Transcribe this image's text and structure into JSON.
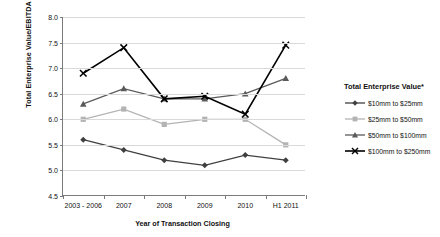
{
  "chart_data": {
    "type": "line",
    "title": "",
    "xlabel": "Year of Transaction Closing",
    "ylabel": "Total Enterprise Value/EBITDA",
    "categories": [
      "2003 - 2006",
      "2007",
      "2008",
      "2009",
      "2010",
      "H1 2011"
    ],
    "ylim": [
      4.5,
      8.0
    ],
    "ytick_step": 0.5,
    "yticks": [
      "8.0",
      "7.5",
      "7.0",
      "6.5",
      "6.0",
      "5.5",
      "5.0",
      "4.5"
    ],
    "ytick_values": [
      8.0,
      7.5,
      7.0,
      6.5,
      6.0,
      5.5,
      5.0,
      4.5
    ],
    "grid": true,
    "legend_position": "right",
    "legend_title": "Total Enterprise Value*",
    "series": [
      {
        "name": "$10mm to $25mm",
        "marker": "diamond",
        "color": "#404040",
        "values": [
          5.6,
          5.4,
          5.2,
          5.1,
          5.3,
          5.2
        ]
      },
      {
        "name": "$25mm to $50mm",
        "marker": "square",
        "color": "#b3b3b3",
        "values": [
          6.0,
          6.2,
          5.9,
          6.0,
          6.0,
          5.5
        ]
      },
      {
        "name": "$50mm to $100mm",
        "marker": "triangle",
        "color": "#5a5a5a",
        "values": [
          6.3,
          6.6,
          6.4,
          6.4,
          6.5,
          6.8
        ]
      },
      {
        "name": "$100mm to $250mm",
        "marker": "cross",
        "color": "#000000",
        "values": [
          6.9,
          7.4,
          6.4,
          6.45,
          6.1,
          7.45
        ]
      }
    ]
  }
}
